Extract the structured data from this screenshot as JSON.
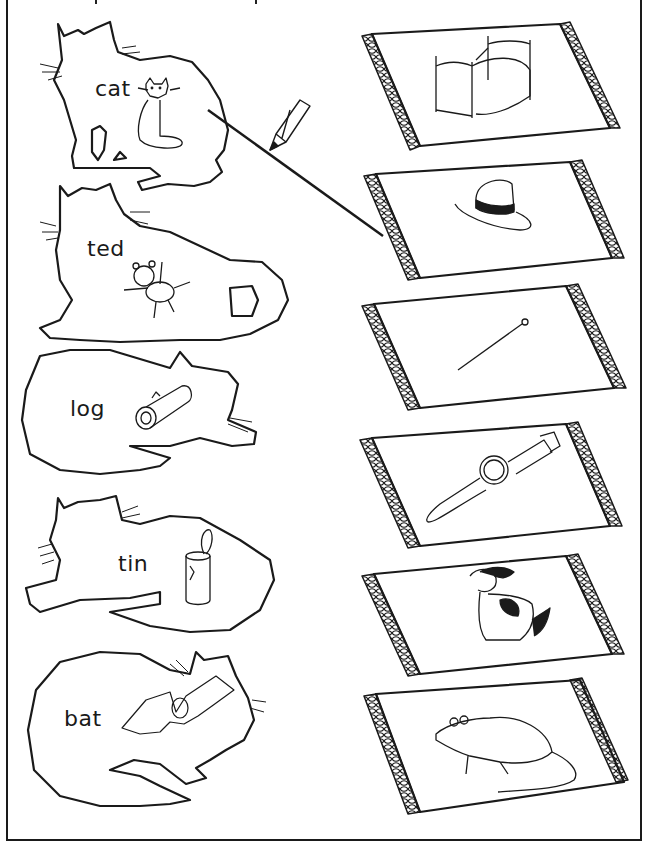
{
  "worksheet": {
    "instruction_visible": false,
    "colors": {
      "ink": "#1a1a1a",
      "paper": "#ffffff"
    },
    "cats": [
      {
        "word": "cat",
        "picture": "cat-icon"
      },
      {
        "word": "ted",
        "picture": "teddy-bear-icon"
      },
      {
        "word": "log",
        "picture": "log-icon"
      },
      {
        "word": "tin",
        "picture": "tin-can-icon"
      },
      {
        "word": "bat",
        "picture": "bat-icon"
      }
    ],
    "rugs": [
      {
        "picture": "bed-icon"
      },
      {
        "picture": "hat-icon"
      },
      {
        "picture": "pin-icon"
      },
      {
        "picture": "watch-icon"
      },
      {
        "picture": "dog-icon"
      },
      {
        "picture": "rat-icon"
      }
    ],
    "example_match": {
      "from": "cat",
      "to": "hat",
      "tool": "pencil-icon"
    }
  }
}
